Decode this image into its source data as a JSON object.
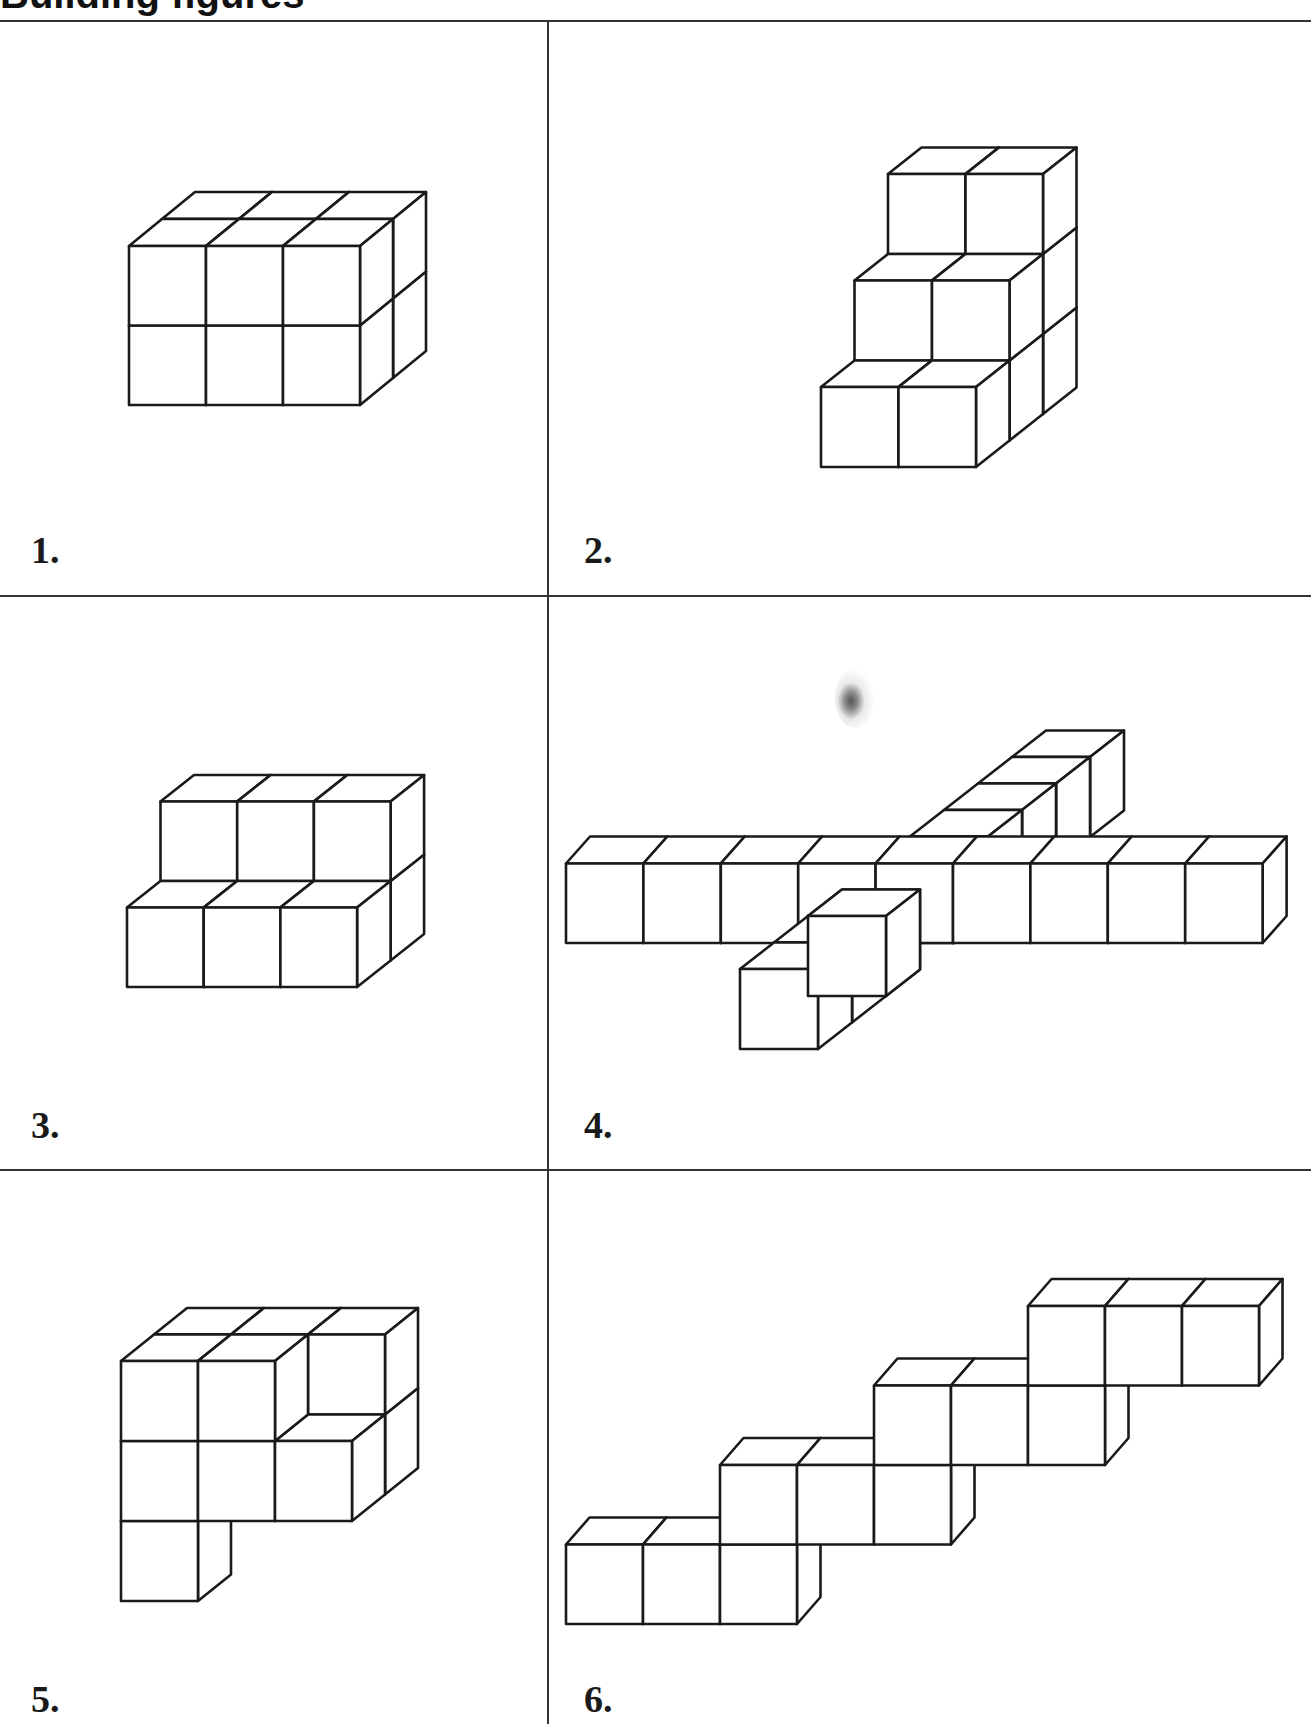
{
  "page": {
    "heading_fragment": "Building figures",
    "stroke_color": "#1a1a1a",
    "fill_color": "#ffffff",
    "line_color": "#333333"
  },
  "panels": [
    {
      "label": "1.",
      "figure": {
        "origin": [
          129,
          405
        ],
        "unit": [
          77,
          79.5
        ],
        "depth": [
          33,
          -27
        ],
        "cubes": [
          [
            0,
            0,
            0
          ],
          [
            1,
            0,
            0
          ],
          [
            2,
            0,
            0
          ],
          [
            0,
            1,
            0
          ],
          [
            1,
            1,
            0
          ],
          [
            2,
            1,
            0
          ],
          [
            0,
            0,
            1
          ],
          [
            1,
            0,
            1
          ],
          [
            2,
            0,
            1
          ],
          [
            0,
            1,
            1
          ],
          [
            1,
            1,
            1
          ],
          [
            2,
            1,
            1
          ]
        ]
      }
    },
    {
      "label": "2.",
      "figure": {
        "origin": [
          821,
          467
        ],
        "unit": [
          77.5,
          80
        ],
        "depth": [
          33.5,
          -26.5
        ],
        "cubes": [
          [
            0,
            0,
            0
          ],
          [
            1,
            0,
            0
          ],
          [
            0,
            0,
            1
          ],
          [
            1,
            0,
            1
          ],
          [
            0,
            1,
            1
          ],
          [
            1,
            1,
            1
          ],
          [
            0,
            0,
            2
          ],
          [
            1,
            0,
            2
          ],
          [
            0,
            1,
            2
          ],
          [
            1,
            1,
            2
          ],
          [
            0,
            2,
            2
          ],
          [
            1,
            2,
            2
          ]
        ]
      }
    },
    {
      "label": "3.",
      "figure": {
        "origin": [
          127,
          987
        ],
        "unit": [
          76.7,
          79.5
        ],
        "depth": [
          33.5,
          -26.5
        ],
        "cubes": [
          [
            0,
            0,
            0
          ],
          [
            1,
            0,
            0
          ],
          [
            2,
            0,
            0
          ],
          [
            0,
            0,
            1
          ],
          [
            1,
            0,
            1
          ],
          [
            2,
            0,
            1
          ],
          [
            0,
            1,
            1
          ],
          [
            1,
            1,
            1
          ],
          [
            2,
            1,
            1
          ]
        ]
      }
    },
    {
      "label": "4.",
      "figure": {
        "origin": [
          566,
          943
        ],
        "unit": [
          77.4,
          79.5
        ],
        "depth": [
          24,
          -27
        ],
        "cubes_row": "nine cubes in a row",
        "cubes": [
          [
            0,
            0,
            0
          ],
          [
            1,
            0,
            0
          ],
          [
            2,
            0,
            0
          ],
          [
            3,
            0,
            0
          ],
          [
            4,
            0,
            0
          ],
          [
            5,
            0,
            0
          ],
          [
            6,
            0,
            0
          ],
          [
            7,
            0,
            0
          ],
          [
            8,
            0,
            0
          ]
        ],
        "arm": {
          "origin": [
            740,
            1049
          ],
          "unit": [
            78,
            80
          ],
          "depth": [
            34,
            -26.5
          ],
          "count": 9,
          "row_index": 3
        }
      }
    },
    {
      "label": "5.",
      "figure": {
        "origin": [
          121,
          1601
        ],
        "unit": [
          77,
          80
        ],
        "depth": [
          33,
          -26.5
        ],
        "cubes": [
          [
            0,
            0,
            0
          ],
          [
            0,
            1,
            0
          ],
          [
            1,
            1,
            0
          ],
          [
            2,
            1,
            0
          ],
          [
            0,
            2,
            0
          ],
          [
            1,
            2,
            0
          ],
          [
            0,
            1,
            1
          ],
          [
            1,
            1,
            1
          ],
          [
            2,
            1,
            1
          ],
          [
            0,
            2,
            1
          ],
          [
            1,
            2,
            1
          ],
          [
            2,
            2,
            1
          ]
        ]
      }
    },
    {
      "label": "6.",
      "figure": {
        "origin": [
          566,
          1624
        ],
        "unit": [
          77,
          79.5
        ],
        "depth": [
          23.5,
          -27
        ],
        "cubes": [
          [
            0,
            0,
            0
          ],
          [
            1,
            0,
            0
          ],
          [
            2,
            0,
            0
          ],
          [
            2,
            1,
            0
          ],
          [
            3,
            1,
            0
          ],
          [
            4,
            1,
            0
          ],
          [
            4,
            2,
            0
          ],
          [
            5,
            2,
            0
          ],
          [
            6,
            2,
            0
          ],
          [
            6,
            3,
            0
          ],
          [
            7,
            3,
            0
          ],
          [
            8,
            3,
            0
          ]
        ]
      }
    }
  ]
}
